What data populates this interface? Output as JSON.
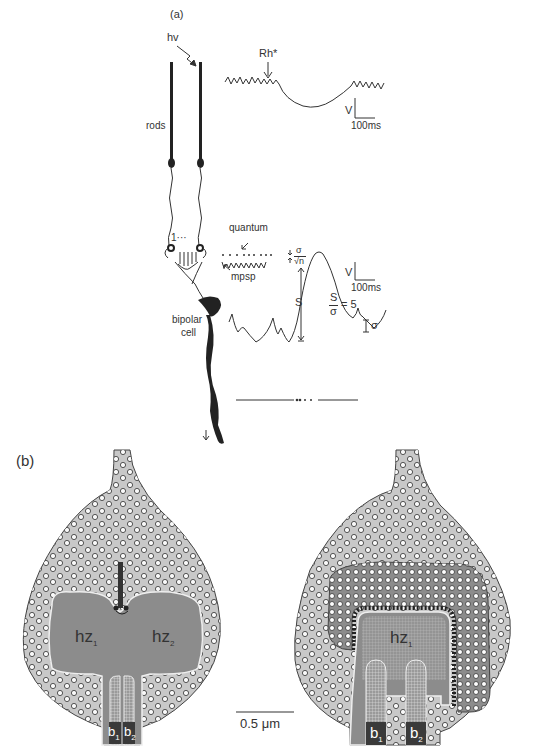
{
  "panel_a": {
    "label": "(a)",
    "photon_label": "hv",
    "rhodopsin_label": "Rh*",
    "rods_label": "rods",
    "scale1": {
      "v": "V",
      "t": "100ms"
    },
    "count_label": "1···",
    "quantum_label": "quantum",
    "mpsp_label": "mpsp",
    "noise_formula": {
      "pm": "±",
      "num": "σ",
      "den": "√n"
    },
    "scale2": {
      "v": "V",
      "t": "100ms"
    },
    "signal_label": "S",
    "snr_formula": {
      "num": "S",
      "den": "σ",
      "eq": "= 5"
    },
    "sigma_label": "σ",
    "bipolar_label": "bipolar\ncell",
    "bipolar_line1": "bipolar",
    "bipolar_line2": "cell",
    "ellipsis": "••· •"
  },
  "panel_b": {
    "label": "(b)",
    "left_terminal": {
      "hz1": "hz",
      "hz1_sub": "1",
      "hz2": "hz",
      "hz2_sub": "2",
      "b1": "b",
      "b1_sub": "1",
      "b2": "b",
      "b2_sub": "2"
    },
    "right_terminal": {
      "hz1": "hz",
      "hz1_sub": "1",
      "b1": "b",
      "b1_sub": "1",
      "b2": "b",
      "b2_sub": "2"
    },
    "scale_bar": "0.5 μm"
  },
  "colors": {
    "terminal_fill": "#c8c8c8",
    "hz_fill": "#8c8c8c",
    "bipolar_fill": "#3a3a3a",
    "line": "#333333"
  }
}
